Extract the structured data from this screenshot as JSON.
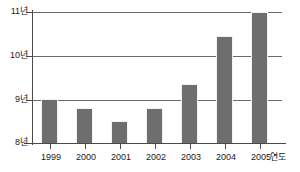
{
  "chart_data": {
    "type": "bar",
    "title": "",
    "subtitle": "",
    "xlabel": "연도",
    "ylabel": "",
    "categories": [
      "1999",
      "2000",
      "2001",
      "2002",
      "2003",
      "2004",
      "2005"
    ],
    "values": [
      9.0,
      8.8,
      8.5,
      8.8,
      9.35,
      10.45,
      11.0
    ],
    "series": [
      {
        "name": "",
        "values": [
          9.0,
          8.8,
          8.5,
          8.8,
          9.35,
          10.45,
          11.0
        ]
      }
    ],
    "ylim": [
      8,
      11
    ],
    "ytick_values": [
      8,
      9,
      10,
      11
    ],
    "ytick_labels": [
      "8년",
      "9년",
      "10년",
      "11년"
    ],
    "xtick_labels": [
      "1999",
      "2000",
      "2001",
      "2002",
      "2003",
      "2004",
      "2005"
    ],
    "grid": true,
    "legend": null,
    "legend_position": "none",
    "unit_suffix": "년",
    "annotations": [],
    "colors": {
      "bar_fill": "#6e6e6e",
      "gridline": "#6a6a6a",
      "axis": "#4a4a4a",
      "text": "#1a1a1a",
      "background": "#ffffff"
    }
  }
}
